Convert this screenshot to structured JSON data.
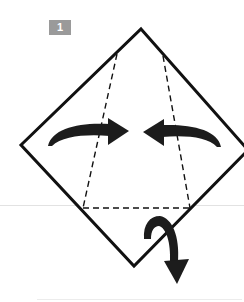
{
  "step": {
    "number": "1",
    "badge_color": "#9a9a9a"
  },
  "diagram": {
    "type": "origami-fold-instruction",
    "paper": {
      "shape": "diamond-square",
      "vertices": {
        "top": [
          141,
          29
        ],
        "left": [
          21,
          145
        ],
        "bottom": [
          134,
          266
        ],
        "right": [
          248,
          150
        ]
      },
      "stroke_color": "#111111"
    },
    "fold_lines": [
      {
        "name": "left-valley-fold",
        "from": [
          117,
          54
        ],
        "to": [
          83,
          208
        ]
      },
      {
        "name": "right-valley-fold",
        "from": [
          163,
          56
        ],
        "to": [
          190,
          208
        ]
      },
      {
        "name": "bottom-valley-fold",
        "from": [
          83,
          208
        ],
        "to": [
          190,
          208
        ]
      }
    ],
    "arrows": [
      {
        "name": "fold-left-flap-right",
        "direction": "right"
      },
      {
        "name": "fold-right-flap-left",
        "direction": "left"
      },
      {
        "name": "fold-bottom-flap-behind",
        "direction": "down-under"
      }
    ],
    "arrow_color": "#1c1c1c"
  }
}
